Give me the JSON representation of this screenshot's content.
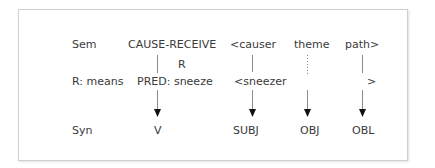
{
  "rows": {
    "sem": {
      "label": "Sem",
      "predicate": "CAUSE-RECEIVE",
      "args": [
        "<causer",
        "theme",
        "path>"
      ]
    },
    "r": {
      "label": "R: means",
      "marker": "R",
      "predicate": "PRED: sneeze",
      "args": [
        "<sneezer",
        "",
        ">"
      ]
    },
    "syn": {
      "label": "Syn",
      "functions": [
        "V",
        "SUBJ",
        "OBJ",
        "OBL"
      ]
    }
  },
  "links": [
    {
      "from": "CAUSE-RECEIVE",
      "to": "PRED: sneeze",
      "style": "solid"
    },
    {
      "from": "PRED: sneeze",
      "to": "V",
      "style": "arrow"
    },
    {
      "from": "<causer",
      "to": "<sneezer",
      "style": "solid"
    },
    {
      "from": "<sneezer",
      "to": "SUBJ",
      "style": "arrow"
    },
    {
      "from": "theme",
      "to": "OBJ",
      "style": "dotted-then-arrow"
    },
    {
      "from": "path>",
      "to": "OBL",
      "style": "solid-then-arrow"
    }
  ]
}
